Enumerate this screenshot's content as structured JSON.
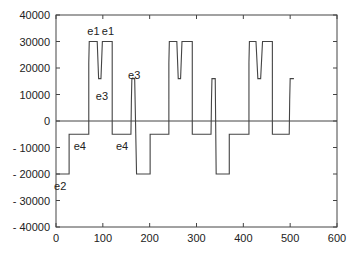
{
  "chart_data": {
    "type": "line",
    "title": "",
    "xlabel": "",
    "ylabel": "",
    "xlim": [
      0,
      600
    ],
    "ylim": [
      -40000,
      40000
    ],
    "grid": false,
    "legend": "none",
    "x_ticks": [
      0,
      100,
      200,
      300,
      400,
      500,
      600
    ],
    "x_tick_labels": [
      "0",
      "100",
      "200",
      "300",
      "400",
      "500",
      "600"
    ],
    "y_ticks": [
      40000,
      30000,
      20000,
      10000,
      0,
      -10000,
      -20000,
      -30000,
      -40000
    ],
    "y_tick_labels": [
      "40000",
      "30000",
      "20000",
      "10000",
      "0",
      "- 10000",
      "- 20000",
      "- 30000",
      "- 40000"
    ],
    "reference_lines": [
      {
        "axis": "y",
        "value": 0
      }
    ],
    "series": [
      {
        "name": "signal",
        "style": "step",
        "points": [
          [
            0,
            -20000
          ],
          [
            28,
            -20000
          ],
          [
            28,
            -5000
          ],
          [
            70,
            -5000
          ],
          [
            70,
            22000
          ],
          [
            71,
            30000
          ],
          [
            88,
            30000
          ],
          [
            91,
            16000
          ],
          [
            96,
            16000
          ],
          [
            99,
            30000
          ],
          [
            120,
            30000
          ],
          [
            120,
            -5000
          ],
          [
            160,
            -5000
          ],
          [
            161,
            8000
          ],
          [
            162,
            16000
          ],
          [
            168,
            16000
          ],
          [
            172,
            -20000
          ],
          [
            201,
            -20000
          ],
          [
            201,
            -5000
          ],
          [
            241,
            -5000
          ],
          [
            241,
            22000
          ],
          [
            242,
            30000
          ],
          [
            258,
            30000
          ],
          [
            261,
            16000
          ],
          [
            266,
            16000
          ],
          [
            269,
            30000
          ],
          [
            291,
            30000
          ],
          [
            291,
            -5000
          ],
          [
            331,
            -5000
          ],
          [
            332,
            8000
          ],
          [
            333,
            16000
          ],
          [
            340,
            16000
          ],
          [
            342,
            -20000
          ],
          [
            370,
            -20000
          ],
          [
            370,
            -5000
          ],
          [
            412,
            -5000
          ],
          [
            412,
            22000
          ],
          [
            413,
            30000
          ],
          [
            427,
            30000
          ],
          [
            431,
            16000
          ],
          [
            437,
            16000
          ],
          [
            441,
            30000
          ],
          [
            462,
            30000
          ],
          [
            462,
            -5000
          ],
          [
            498,
            -5000
          ],
          [
            499,
            8000
          ],
          [
            500,
            16000
          ],
          [
            508,
            16000
          ]
        ]
      }
    ],
    "annotations": [
      {
        "text": "e1",
        "x": 80,
        "y": 34000
      },
      {
        "text": "e1",
        "x": 111,
        "y": 34000
      },
      {
        "text": "e3",
        "x": 98,
        "y": 9500
      },
      {
        "text": "e3",
        "x": 167,
        "y": 17500
      },
      {
        "text": "e4",
        "x": 51,
        "y": -9500
      },
      {
        "text": "e4",
        "x": 141,
        "y": -9500
      },
      {
        "text": "e2",
        "x": 9,
        "y": -24500
      }
    ]
  }
}
